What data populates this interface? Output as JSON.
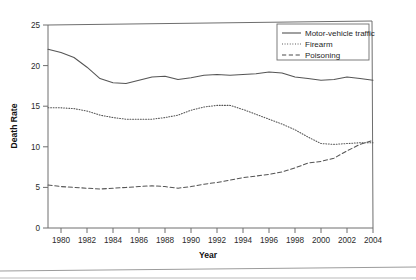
{
  "chart_data": {
    "type": "line",
    "title": "",
    "xlabel": "Year",
    "ylabel": "Death Rate",
    "xlim": [
      1979,
      2004
    ],
    "ylim": [
      0,
      25
    ],
    "grid": false,
    "legend_position": "top-right",
    "x_tick_labels": [
      "1980",
      "1982",
      "1984",
      "1986",
      "1988",
      "1990",
      "1992",
      "1994",
      "1996",
      "1998",
      "2000",
      "2002",
      "2004"
    ],
    "x_ticks": [
      1980,
      1982,
      1984,
      1986,
      1988,
      1990,
      1992,
      1994,
      1996,
      1998,
      2000,
      2002,
      2004
    ],
    "y_tick_labels": [
      "0",
      "5",
      "10",
      "15",
      "20",
      "25"
    ],
    "y_ticks": [
      0,
      5,
      10,
      15,
      20,
      25
    ],
    "x": [
      1979,
      1980,
      1981,
      1982,
      1983,
      1984,
      1985,
      1986,
      1987,
      1988,
      1989,
      1990,
      1991,
      1992,
      1993,
      1994,
      1995,
      1996,
      1997,
      1998,
      1999,
      2000,
      2001,
      2002,
      2003,
      2004
    ],
    "series": [
      {
        "name": "Motor-vehicle traffic",
        "style": "solid",
        "values": [
          22.0,
          21.6,
          21.0,
          19.8,
          18.4,
          17.9,
          17.8,
          18.2,
          18.6,
          18.7,
          18.3,
          18.5,
          18.8,
          18.9,
          18.8,
          18.9,
          19.0,
          19.2,
          19.1,
          18.6,
          18.4,
          18.2,
          18.3,
          18.6,
          18.4,
          18.2
        ]
      },
      {
        "name": "Firearm",
        "style": "dotted",
        "values": [
          14.8,
          14.8,
          14.7,
          14.4,
          13.9,
          13.6,
          13.4,
          13.4,
          13.4,
          13.6,
          13.9,
          14.5,
          14.9,
          15.1,
          15.1,
          14.6,
          14.0,
          13.4,
          12.8,
          12.1,
          11.2,
          10.4,
          10.3,
          10.4,
          10.5,
          10.5
        ]
      },
      {
        "name": "Poisoning",
        "style": "dashed",
        "values": [
          5.3,
          5.1,
          5.0,
          4.9,
          4.8,
          4.9,
          5.0,
          5.1,
          5.2,
          5.1,
          4.9,
          5.1,
          5.4,
          5.6,
          5.9,
          6.2,
          6.4,
          6.6,
          6.9,
          7.4,
          8.0,
          8.2,
          8.6,
          9.5,
          10.3,
          10.8
        ]
      }
    ]
  },
  "legend": {
    "entries": [
      {
        "label": "Motor-vehicle traffic",
        "style": "solid"
      },
      {
        "label": "Firearm",
        "style": "dotted"
      },
      {
        "label": "Poisoning",
        "style": "dashed"
      }
    ]
  },
  "axis": {
    "x_title": "Year",
    "y_title": "Death Rate"
  }
}
